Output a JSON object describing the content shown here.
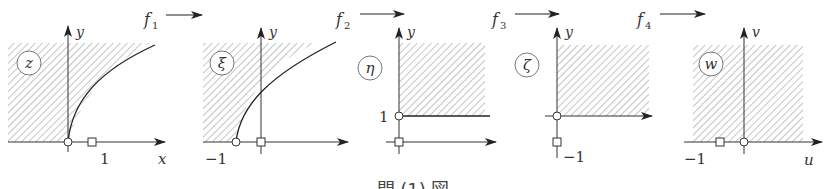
{
  "diagram": {
    "caption": "問 (1) 図",
    "colors": {
      "stroke": "#333333",
      "hatch": "#8a8a8a",
      "background": "#ffffff"
    },
    "maps": [
      {
        "label": "f",
        "subscript": "1"
      },
      {
        "label": "f",
        "subscript": "2"
      },
      {
        "label": "f",
        "subscript": "3"
      },
      {
        "label": "f",
        "subscript": "4"
      }
    ],
    "panels": [
      {
        "plane": "z",
        "h_axis": "x",
        "v_axis": "y",
        "ticks": [
          "1"
        ],
        "region": "left of parabola-like curve from origin, upper half"
      },
      {
        "plane": "ξ",
        "h_axis": "",
        "v_axis": "y",
        "ticks": [
          "−1"
        ],
        "region": "left of curve starting at −1, upper half"
      },
      {
        "plane": "η",
        "h_axis": "",
        "v_axis": "y",
        "ticks": [
          "1"
        ],
        "region": "quadrant above y=1, right of y-axis"
      },
      {
        "plane": "ζ",
        "h_axis": "",
        "v_axis": "y",
        "ticks": [
          "−1"
        ],
        "region": "first quadrant"
      },
      {
        "plane": "w",
        "h_axis": "u",
        "v_axis": "v",
        "ticks": [
          "−1"
        ],
        "region": "upper half plane"
      }
    ]
  }
}
